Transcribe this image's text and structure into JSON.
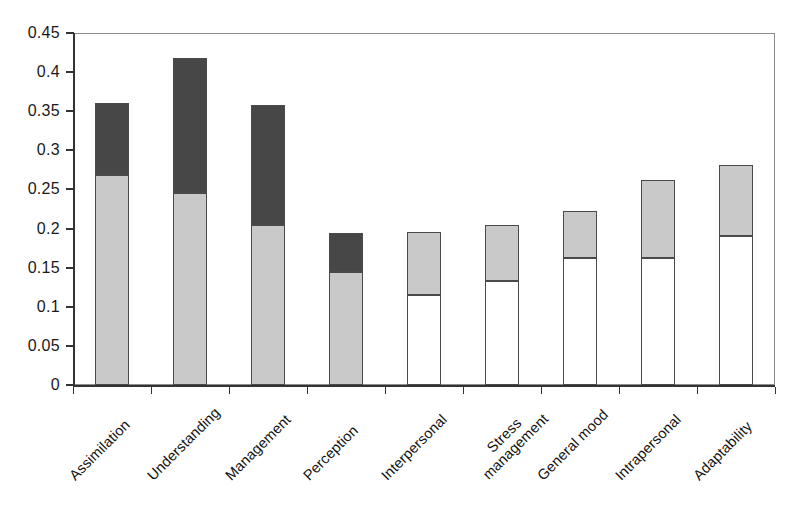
{
  "chart_data": {
    "type": "bar",
    "subtype": "stacked-bar",
    "title": "",
    "xlabel": "",
    "ylabel": "",
    "ylim": [
      0,
      0.45
    ],
    "grid": false,
    "legend": "none",
    "categories": [
      "Assimilation",
      "Understanding",
      "Management",
      "Perception",
      "Interpersonal",
      "Stress management",
      "General mood",
      "Intrapersonal",
      "Adaptability"
    ],
    "ytick_labels": [
      "0",
      "0.05",
      "0.1",
      "0.15",
      "0.2",
      "0.25",
      "0.3",
      "0.35",
      "0.4",
      "0.45"
    ],
    "ytick_values": [
      0,
      0.05,
      0.1,
      0.15,
      0.2,
      0.25,
      0.3,
      0.35,
      0.4,
      0.45
    ],
    "series": [
      {
        "name": "lower-segment",
        "color": "#c9c9c9",
        "values": [
          0.268,
          0.246,
          0.205,
          0.145,
          0.115,
          0.133,
          0.162,
          0.162,
          0.191
        ]
      },
      {
        "name": "upper-segment",
        "color": "#474747",
        "values": [
          0.092,
          0.172,
          0.153,
          0.049,
          0.08,
          0.071,
          0.06,
          0.1,
          0.09
        ]
      }
    ],
    "totals": [
      0.36,
      0.418,
      0.358,
      0.194,
      0.195,
      0.204,
      0.222,
      0.262,
      0.281
    ],
    "bar_styles": [
      {
        "lower": "light",
        "upper": "dark"
      },
      {
        "lower": "light",
        "upper": "dark"
      },
      {
        "lower": "light",
        "upper": "dark"
      },
      {
        "lower": "light",
        "upper": "dark"
      },
      {
        "lower": "white",
        "upper": "light"
      },
      {
        "lower": "white",
        "upper": "light"
      },
      {
        "lower": "white",
        "upper": "light"
      },
      {
        "lower": "white",
        "upper": "light"
      },
      {
        "lower": "white",
        "upper": "light"
      }
    ],
    "colors": {
      "dark_segment": "#474747",
      "light_segment": "#c9c9c9",
      "white_segment": "#ffffff",
      "outline": "#4a4a4a",
      "axis": "#333333",
      "frame": "#8c8c8c"
    }
  }
}
